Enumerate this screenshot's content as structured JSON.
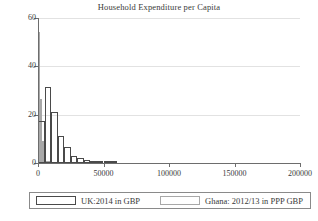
{
  "chart_data": {
    "type": "bar",
    "title": "Household Expenditure per Capita",
    "xlabel": "",
    "ylabel": "",
    "xlim": [
      0,
      200000
    ],
    "ylim": [
      0,
      60
    ],
    "grid": true,
    "legend_position": "bottom",
    "xticks": [
      0,
      50000,
      100000,
      150000,
      200000
    ],
    "xtick_labels": [
      "0",
      "50000",
      "100000",
      "150000",
      "200000"
    ],
    "yticks": [
      0,
      20,
      40,
      60
    ],
    "ytick_labels": [
      "0",
      "20",
      "40",
      "60"
    ],
    "bin_width": 5000,
    "series": [
      {
        "name": "UK:2014 in GBP",
        "color": "#4a4a4a",
        "bins": [
          0,
          5000,
          10000,
          15000,
          20000,
          25000,
          30000,
          35000,
          40000,
          45000,
          50000,
          55000,
          60000
        ],
        "values": [
          17.5,
          31.5,
          21.2,
          11.2,
          6.6,
          3.1,
          2.0,
          1.3,
          0.9,
          0.6,
          0.3,
          0.2
        ]
      },
      {
        "name": "Ghana: 2012/13 in PPP GBP",
        "color": "#a8a8a8",
        "bins": [
          0,
          1500,
          3000,
          4500,
          6000,
          7500,
          9000
        ],
        "values": [
          54.2,
          26.3,
          9.2,
          2.6,
          1.0,
          0.4
        ]
      }
    ]
  },
  "legend": {
    "entries": [
      {
        "label": "UK:2014 in GBP"
      },
      {
        "label": "Ghana: 2012/13 in PPP GBP"
      }
    ]
  }
}
